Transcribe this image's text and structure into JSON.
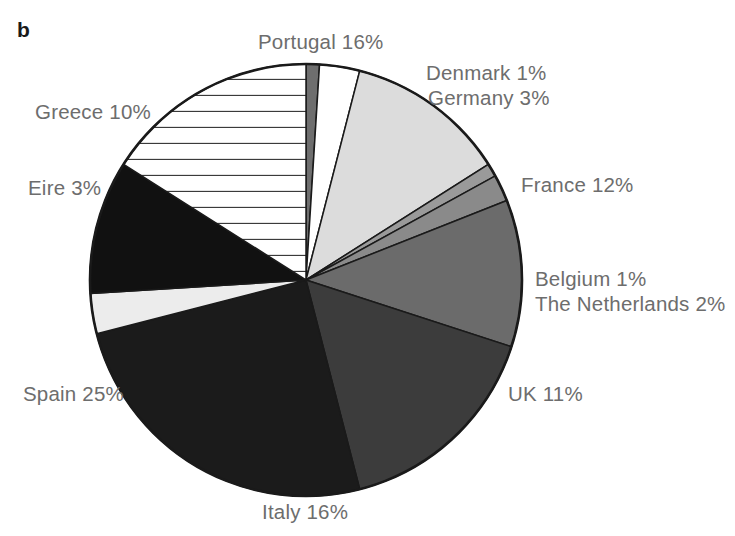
{
  "figure": {
    "panel_letter": "b",
    "width": 735,
    "height": 536
  },
  "chart_data": {
    "type": "pie",
    "title": "",
    "xlabel": "",
    "ylabel": "",
    "legend_position": "outside-labels",
    "grid": false,
    "units": "percent",
    "start_angle_deg": 0,
    "direction": "clockwise",
    "center": [
      306,
      280
    ],
    "radius": 216,
    "categories": [
      "Denmark",
      "Germany",
      "France",
      "Belgium",
      "The Netherlands",
      "UK",
      "Italy",
      "Spain",
      "Eire",
      "Greece",
      "Portugal"
    ],
    "values": [
      1,
      3,
      12,
      1,
      2,
      11,
      16,
      25,
      3,
      10,
      16
    ],
    "slices": [
      {
        "name": "Denmark",
        "value": 1,
        "label": "Denmark 1%",
        "fill": "#6e6e6e",
        "pattern": "solid"
      },
      {
        "name": "Germany",
        "value": 3,
        "label": "Germany 3%",
        "fill": "#ffffff",
        "pattern": "solid"
      },
      {
        "name": "France",
        "value": 12,
        "label": "France 12%",
        "fill": "#dcdcdc",
        "pattern": "solid"
      },
      {
        "name": "Belgium",
        "value": 1,
        "label": "Belgium 1%",
        "fill": "#9a9a9a",
        "pattern": "solid"
      },
      {
        "name": "The Netherlands",
        "value": 2,
        "label": "The Netherlands 2%",
        "fill": "#8a8a8a",
        "pattern": "solid"
      },
      {
        "name": "UK",
        "value": 11,
        "label": "UK 11%",
        "fill": "#6b6b6b",
        "pattern": "solid"
      },
      {
        "name": "Italy",
        "value": 16,
        "label": "Italy 16%",
        "fill": "#3c3c3c",
        "pattern": "solid"
      },
      {
        "name": "Spain",
        "value": 25,
        "label": "Spain 25%",
        "fill": "#1b1b1b",
        "pattern": "solid"
      },
      {
        "name": "Eire",
        "value": 3,
        "label": "Eire 3%",
        "fill": "#ececec",
        "pattern": "solid"
      },
      {
        "name": "Greece",
        "value": 10,
        "label": "Greece 10%",
        "fill": "#111111",
        "pattern": "solid"
      },
      {
        "name": "Portugal",
        "value": 16,
        "label": "Portugal 16%",
        "fill": "#ffffff",
        "pattern": "horizontal-lines"
      }
    ],
    "colors": {
      "outline": "#1a1a1a",
      "label_text": "#6d6d6d",
      "panel_letter": "#1a1a1a",
      "background": "#ffffff"
    }
  },
  "labels": {
    "portugal": "Portugal 16%",
    "denmark": "Denmark 1%",
    "germany": "Germany 3%",
    "france": "France 12%",
    "belgium": "Belgium 1%",
    "netherlands": "The Netherlands 2%",
    "uk": "UK 11%",
    "italy": "Italy 16%",
    "spain": "Spain 25%",
    "eire": "Eire 3%",
    "greece": "Greece 10%"
  }
}
